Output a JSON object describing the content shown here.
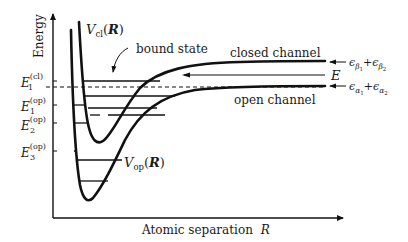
{
  "diagram": {
    "type": "potential-energy-curves",
    "axes": {
      "y_label": "Energy",
      "x_label": "Atomic separation",
      "x_label_var": "R"
    },
    "curves": {
      "closed": {
        "symbol": "V",
        "subscript": "cl",
        "arg_open": "(",
        "arg": "R",
        "arg_close": ")",
        "channel_label": "closed channel",
        "asymptote_label_a": "ϵ",
        "asymptote_sub_a": "β",
        "asymptote_subsub_a": "1",
        "asymptote_plus": "+",
        "asymptote_label_b": "ϵ",
        "asymptote_sub_b": "β",
        "asymptote_subsub_b": "2"
      },
      "open": {
        "symbol": "V",
        "subscript": "op",
        "arg_open": "(",
        "arg": "R",
        "arg_close": ")",
        "channel_label": "open channel",
        "asymptote_label_a": "ϵ",
        "asymptote_sub_a": "α",
        "asymptote_subsub_a": "1",
        "asymptote_plus": "+",
        "asymptote_label_b": "ϵ",
        "asymptote_sub_b": "α",
        "asymptote_subsub_b": "2"
      }
    },
    "annotations": {
      "bound_state": "bound state",
      "energy": "E"
    },
    "levels": [
      {
        "name": "E",
        "sub": "1",
        "sup": "(cl)"
      },
      {
        "name": "E",
        "sub": "1",
        "sup": "(op)"
      },
      {
        "name": "E",
        "sub": "2",
        "sup": "(op)"
      },
      {
        "name": "E",
        "sub": "3",
        "sup": "(op)"
      }
    ],
    "colors": {
      "ink": "#111111",
      "background": "#ffffff"
    }
  }
}
